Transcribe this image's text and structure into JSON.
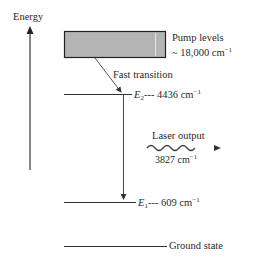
{
  "diagram": {
    "axis": {
      "label": "Energy"
    },
    "pump": {
      "title": "Pump levels",
      "value": "~ 18,000 cm",
      "exponent": "−1",
      "fill": "#b4b4b4"
    },
    "fast_transition": {
      "label": "Fast transition"
    },
    "levels": [
      {
        "name": "E",
        "subscript": "2",
        "dashes": "---",
        "value": "4436 cm",
        "exponent": "−1"
      },
      {
        "name": "E",
        "subscript": "1",
        "dashes": "---",
        "value": "609 cm",
        "exponent": "−1"
      },
      {
        "name": "Ground state"
      }
    ],
    "laser": {
      "title": "Laser output",
      "value": "3827 cm",
      "exponent": "−1"
    }
  }
}
